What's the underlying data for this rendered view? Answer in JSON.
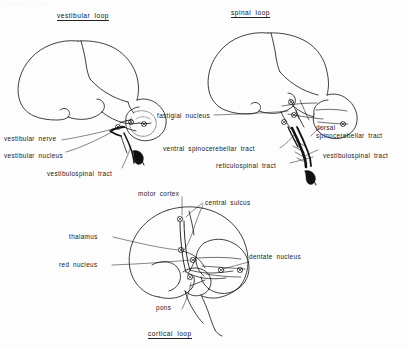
{
  "page": {
    "background_color": "#fdfdfd",
    "ink_color": "#111111",
    "scan_artifact_text": "- -- -- -- --"
  },
  "panels": [
    {
      "id": "vestibular-loop",
      "title": "vestibular  loop",
      "labels": [
        {
          "name": "vestibular-nerve",
          "text": "vestibular  nerve"
        },
        {
          "name": "vestibular-nucleus",
          "text": "vestibular  nucleus"
        },
        {
          "name": "vestibulospinal-tract",
          "text": "vestibulospinal  tract"
        }
      ]
    },
    {
      "id": "spinal-loop",
      "title": "spinal  loop",
      "labels": [
        {
          "name": "fastigial-nucleus",
          "text": "fastigial  nucleus"
        },
        {
          "name": "ventral-spinocerebellar-tract",
          "text": "ventral  spinocerebellar  tract"
        },
        {
          "name": "dorsal-spinocerebellar-tract-line1",
          "text": "dorsal"
        },
        {
          "name": "dorsal-spinocerebellar-tract-line2",
          "text": "spinocerebellar  tract"
        },
        {
          "name": "reticulospinal-tract",
          "text": "reticulospinal  tract"
        },
        {
          "name": "vestibulospinal-tract",
          "text": "vestibulospinal  tract"
        }
      ]
    },
    {
      "id": "cortical-loop",
      "title": "cortical  loop",
      "labels": [
        {
          "name": "motor-cortex",
          "text": "motor  cortex"
        },
        {
          "name": "central-sulcus",
          "text": "central  sulcus"
        },
        {
          "name": "thalamus",
          "text": "thalamus"
        },
        {
          "name": "red-nucleus",
          "text": "red  nucleus"
        },
        {
          "name": "pons",
          "text": "pons"
        },
        {
          "name": "dentate-nucleus",
          "text": "dentate  nucleus"
        }
      ]
    }
  ]
}
